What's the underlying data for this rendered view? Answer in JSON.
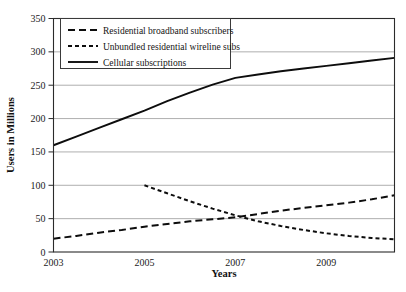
{
  "chart_data": {
    "type": "line",
    "title": "",
    "xlabel": "Years",
    "ylabel": "Users in Millions",
    "xlim": [
      2003,
      2010.5
    ],
    "ylim": [
      0,
      350
    ],
    "ytick_values": [
      0,
      50,
      100,
      150,
      200,
      250,
      300,
      350
    ],
    "ytick_labels": [
      "0",
      "50",
      "100",
      "150",
      "200",
      "250",
      "300",
      "350"
    ],
    "xtick_values": [
      2003,
      2005,
      2007,
      2009
    ],
    "xtick_labels": [
      "2003",
      "2005",
      "2007",
      "2009"
    ],
    "grid": "horizontal",
    "legend_position": "top-left-inside",
    "series": [
      {
        "name": "Residential broadband subscribers",
        "style": "dashed-long",
        "x": [
          2003,
          2003.5,
          2004,
          2004.5,
          2005,
          2005.5,
          2006,
          2006.5,
          2007,
          2007.5,
          2008,
          2008.5,
          2009,
          2009.5,
          2010,
          2010.5
        ],
        "values": [
          20,
          24,
          29,
          33,
          38,
          42,
          46,
          49,
          52,
          57,
          62,
          66,
          70,
          74,
          79,
          85
        ]
      },
      {
        "name": "Unbundled residential wireline subs",
        "style": "dashed-short",
        "x": [
          2005,
          2005.5,
          2006,
          2006.5,
          2007,
          2007.5,
          2008,
          2008.5,
          2009,
          2009.5,
          2010,
          2010.5
        ],
        "values": [
          100,
          88,
          76,
          65,
          55,
          46,
          39,
          33,
          28,
          24,
          21,
          19
        ]
      },
      {
        "name": "Cellular subscriptions",
        "style": "solid",
        "x": [
          2003,
          2003.5,
          2004,
          2004.5,
          2005,
          2005.5,
          2006,
          2006.5,
          2007,
          2007.5,
          2008,
          2008.5,
          2009,
          2009.5,
          2010,
          2010.5
        ],
        "values": [
          160,
          173,
          186,
          199,
          212,
          226,
          239,
          251,
          261,
          266,
          271,
          275,
          279,
          283,
          287,
          291
        ]
      }
    ]
  },
  "legend": {
    "items": [
      {
        "label": "Residential broadband subscribers",
        "style": "dashed-long"
      },
      {
        "label": "Unbundled residential wireline subs",
        "style": "dashed-short"
      },
      {
        "label": "Cellular subscriptions",
        "style": "solid"
      }
    ]
  },
  "colors": {
    "line": "#0d0d0d",
    "grid": "#9a9a9a",
    "frame": "#2b2b2b",
    "background": "#ffffff",
    "text": "#141414"
  }
}
